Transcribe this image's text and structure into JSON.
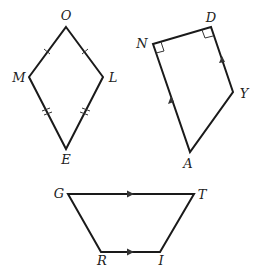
{
  "figures": [
    {
      "name": "kite",
      "vertices": [
        {
          "label": "O",
          "x": 66,
          "y": 27,
          "lx": 66,
          "ly": 20
        },
        {
          "label": "L",
          "x": 103,
          "y": 77,
          "lx": 113,
          "ly": 82
        },
        {
          "label": "E",
          "x": 66,
          "y": 149,
          "lx": 66,
          "ly": 164
        },
        {
          "label": "M",
          "x": 29,
          "y": 77,
          "lx": 19,
          "ly": 82
        }
      ],
      "marks": "single ticks on OM and OL; double ticks on ME and LE"
    },
    {
      "name": "right-trapezoid",
      "vertices": [
        {
          "label": "N",
          "x": 153,
          "y": 44,
          "lx": 142,
          "ly": 48
        },
        {
          "label": "D",
          "x": 211,
          "y": 27,
          "lx": 211,
          "ly": 22
        },
        {
          "label": "Y",
          "x": 233,
          "y": 92,
          "lx": 244,
          "ly": 98
        },
        {
          "label": "A",
          "x": 190,
          "y": 152,
          "lx": 188,
          "ly": 168
        }
      ],
      "marks": "right angles at N and D; parallel arrows on NA and DY"
    },
    {
      "name": "trapezoid",
      "vertices": [
        {
          "label": "G",
          "x": 68,
          "y": 194,
          "lx": 59,
          "ly": 198
        },
        {
          "label": "T",
          "x": 194,
          "y": 194,
          "lx": 202,
          "ly": 199
        },
        {
          "label": "I",
          "x": 160,
          "y": 252,
          "lx": 161,
          "ly": 265
        },
        {
          "label": "R",
          "x": 101,
          "y": 252,
          "lx": 102,
          "ly": 265
        }
      ],
      "marks": "parallel arrows on GT and RI"
    }
  ],
  "labels": {
    "O": "O",
    "L": "L",
    "E": "E",
    "M": "M",
    "N": "N",
    "D": "D",
    "Y": "Y",
    "A": "A",
    "G": "G",
    "T": "T",
    "I": "I",
    "R": "R"
  }
}
